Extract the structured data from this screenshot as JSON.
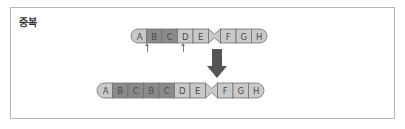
{
  "title": "중복",
  "colors": {
    "frame": "#b5b5b5",
    "light_segment": "#c9c9c9",
    "dark_segment": "#8a8a8a",
    "outline": "#707070",
    "label": "#4a4a4a",
    "arrow": "#555555"
  },
  "before": {
    "segments": [
      {
        "label": "A",
        "shade": "light"
      },
      {
        "label": "B",
        "shade": "dark"
      },
      {
        "label": "C",
        "shade": "dark"
      },
      {
        "label": "D",
        "shade": "light"
      },
      {
        "label": "E",
        "shade": "light"
      },
      {
        "label": "F",
        "shade": "light"
      },
      {
        "label": "G",
        "shade": "light"
      },
      {
        "label": "H",
        "shade": "light"
      }
    ],
    "centromere_after": "E",
    "markers": [
      "A|B",
      "C|D"
    ]
  },
  "after": {
    "segments": [
      {
        "label": "A",
        "shade": "light"
      },
      {
        "label": "B",
        "shade": "dark"
      },
      {
        "label": "C",
        "shade": "dark"
      },
      {
        "label": "B",
        "shade": "dark"
      },
      {
        "label": "C",
        "shade": "dark"
      },
      {
        "label": "D",
        "shade": "light"
      },
      {
        "label": "E",
        "shade": "light"
      },
      {
        "label": "F",
        "shade": "light"
      },
      {
        "label": "G",
        "shade": "light"
      },
      {
        "label": "H",
        "shade": "light"
      }
    ],
    "centromere_after": "E"
  },
  "arrow": {
    "direction": "down"
  }
}
